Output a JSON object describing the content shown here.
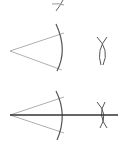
{
  "diagram": {
    "colors": {
      "ray": "#b0b0b0",
      "arc": "#555555",
      "bisector": "#333333",
      "background": "#ffffff"
    },
    "steps": [
      {
        "id": "step-prev-tail",
        "elements": [
          "arc-crossing"
        ]
      },
      {
        "id": "step-arcs",
        "elements": [
          "angle-rays",
          "arc-from-vertex",
          "intersecting-arcs"
        ]
      },
      {
        "id": "step-bisector",
        "elements": [
          "angle-rays",
          "arc-from-vertex",
          "intersecting-arcs",
          "bisector-line"
        ]
      }
    ]
  }
}
